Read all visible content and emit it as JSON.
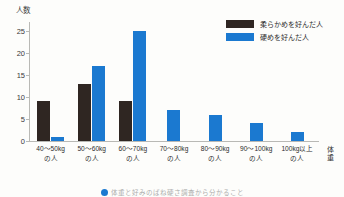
{
  "chart_data": {
    "type": "bar",
    "title": "",
    "xlabel": "体重",
    "ylabel": "人数",
    "ylim": [
      0,
      27
    ],
    "yticks": [
      0,
      5,
      10,
      15,
      20,
      25
    ],
    "grid": false,
    "legend_position": "top-right",
    "categories": [
      "40〜50kg の人",
      "50〜60kg の人",
      "60〜70kg の人",
      "70〜80kg の人",
      "80〜90kg の人",
      "90〜100kg の人",
      "100kg以上 の人"
    ],
    "category_lines": [
      {
        "line1": "40〜50kg",
        "line2": "の人"
      },
      {
        "line1": "50〜60kg",
        "line2": "の人"
      },
      {
        "line1": "60〜70kg",
        "line2": "の人"
      },
      {
        "line1": "70〜80kg",
        "line2": "の人"
      },
      {
        "line1": "80〜90kg",
        "line2": "の人"
      },
      {
        "line1": "90〜100kg",
        "line2": "の人"
      },
      {
        "line1": "100kg以上",
        "line2": "の人"
      }
    ],
    "series": [
      {
        "name": "柔らかめを好んだ人",
        "color": "#2f2622",
        "values": [
          9,
          13,
          9,
          0,
          0,
          0,
          0
        ]
      },
      {
        "name": "硬めを好んだ人",
        "color": "#1b79d0",
        "values": [
          1,
          17,
          25,
          7,
          6,
          4,
          2
        ]
      }
    ]
  },
  "axis": {
    "y_title": "人数",
    "x_title_chars": [
      "体",
      "重"
    ]
  },
  "legend": {
    "items": [
      {
        "label": "柔らかめを好んだ人",
        "color": "#2f2622"
      },
      {
        "label": "硬めを好んだ人",
        "color": "#1b79d0"
      }
    ]
  },
  "footer": {
    "text": "体重と好みのばね硬さ調査から分かること"
  }
}
